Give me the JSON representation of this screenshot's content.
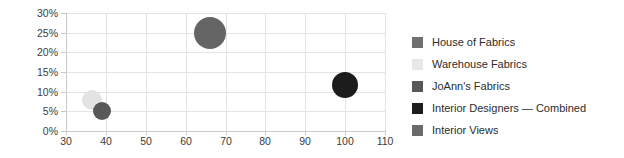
{
  "chart_data": {
    "type": "scatter",
    "title": "",
    "xlabel": "",
    "ylabel": "",
    "xlim": [
      30,
      110
    ],
    "ylim": [
      0,
      30
    ],
    "grid": true,
    "legend_position": "right",
    "x_ticks": [
      "30",
      "40",
      "50",
      "60",
      "70",
      "80",
      "90",
      "100",
      "110"
    ],
    "x_tick_values": [
      30,
      40,
      50,
      60,
      70,
      80,
      90,
      100,
      110
    ],
    "y_ticks": [
      "0%",
      "5%",
      "10%",
      "15%",
      "20%",
      "25%",
      "30%"
    ],
    "y_tick_values": [
      0,
      5,
      10,
      15,
      20,
      25,
      30
    ],
    "series": [
      {
        "name": "House of Fabrics",
        "color": "#656565",
        "x": 66,
        "y": 25,
        "size": 32,
        "visible": true
      },
      {
        "name": "Warehouse Fabrics",
        "color": "#e3e3e3",
        "x": 36.5,
        "y": 8,
        "size": 20,
        "visible": true
      },
      {
        "name": "JoAnn's Fabrics",
        "color": "#585858",
        "x": 39,
        "y": 5,
        "size": 18,
        "visible": true
      },
      {
        "name": "Interior Designers — Combined",
        "color": "#1c1c1c",
        "x": 100,
        "y": 11.7,
        "size": 26,
        "visible": true
      },
      {
        "name": "Interior Views",
        "color": "#6a6a6a",
        "x": null,
        "y": null,
        "size": 0,
        "visible": false
      }
    ]
  },
  "legend": {
    "items": [
      {
        "label": "House of Fabrics",
        "color": "#707070"
      },
      {
        "label": "Warehouse Fabrics",
        "color": "#e8e8e8"
      },
      {
        "label": "JoAnn's Fabrics",
        "color": "#585858"
      },
      {
        "label": "Interior Designers — Combined",
        "color": "#1c1c1c"
      },
      {
        "label": "Interior Views",
        "color": "#6a6a6a"
      }
    ]
  }
}
